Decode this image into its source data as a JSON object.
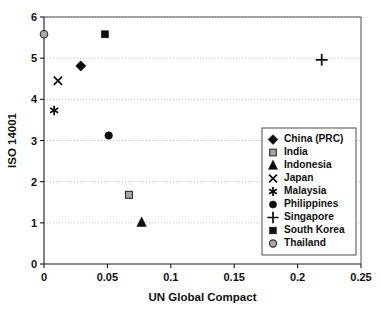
{
  "chart_data": {
    "type": "scatter",
    "title": "",
    "xlabel": "UN Global Compact",
    "ylabel": "ISO 14001",
    "xlim": [
      0,
      0.25
    ],
    "ylim": [
      0,
      6
    ],
    "xticks": [
      "0",
      "0.05",
      "0.1",
      "0.15",
      "0.2",
      "0.25"
    ],
    "xtick_values": [
      0,
      0.05,
      0.1,
      0.15,
      0.2,
      0.25
    ],
    "yticks": [
      "0",
      "1",
      "2",
      "3",
      "4",
      "5",
      "6"
    ],
    "ytick_values": [
      0,
      1,
      2,
      3,
      4,
      5,
      6
    ],
    "grid": "horizontal-dotted",
    "legend_position": "right-middle",
    "points": [
      {
        "name": "China (PRC)",
        "x": 0.029,
        "y": 4.81,
        "marker": "diamond",
        "fill": "#0d0d0d"
      },
      {
        "name": "India",
        "x": 0.067,
        "y": 1.68,
        "marker": "square",
        "fill": "#a8a8a8"
      },
      {
        "name": "Indonesia",
        "x": 0.077,
        "y": 1.01,
        "marker": "triangle",
        "fill": "#0d0d0d"
      },
      {
        "name": "Japan",
        "x": 0.011,
        "y": 4.45,
        "marker": "cross-x",
        "fill": "#0d0d0d"
      },
      {
        "name": "Malaysia",
        "x": 0.008,
        "y": 3.73,
        "marker": "asterisk",
        "fill": "#0d0d0d"
      },
      {
        "name": "Philippines",
        "x": 0.051,
        "y": 3.12,
        "marker": "circle",
        "fill": "#0d0d0d"
      },
      {
        "name": "Singapore",
        "x": 0.219,
        "y": 4.96,
        "marker": "plus",
        "fill": "#0d0d0d"
      },
      {
        "name": "South Korea",
        "x": 0.048,
        "y": 5.58,
        "marker": "square",
        "fill": "#0d0d0d"
      },
      {
        "name": "Thailand",
        "x": 0.0,
        "y": 5.58,
        "marker": "circle",
        "fill": "#a8a8a8"
      }
    ],
    "legend": [
      {
        "label": "China (PRC)",
        "marker": "diamond",
        "fill": "#0d0d0d"
      },
      {
        "label": "India",
        "marker": "square",
        "fill": "#a8a8a8"
      },
      {
        "label": "Indonesia",
        "marker": "triangle",
        "fill": "#0d0d0d"
      },
      {
        "label": "Japan",
        "marker": "cross-x",
        "fill": "#0d0d0d"
      },
      {
        "label": "Malaysia",
        "marker": "asterisk",
        "fill": "#0d0d0d"
      },
      {
        "label": "Philippines",
        "marker": "circle",
        "fill": "#0d0d0d"
      },
      {
        "label": "Singapore",
        "marker": "plus",
        "fill": "#0d0d0d"
      },
      {
        "label": "South Korea",
        "marker": "square",
        "fill": "#0d0d0d"
      },
      {
        "label": "Thailand",
        "marker": "circle",
        "fill": "#a8a8a8"
      }
    ]
  }
}
